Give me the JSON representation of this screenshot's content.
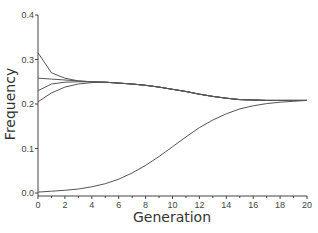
{
  "chart_data": {
    "type": "line",
    "title": "",
    "xlabel": "Generation",
    "ylabel": "Frequency",
    "xlim": [
      0,
      20
    ],
    "ylim": [
      0,
      0.4
    ],
    "grid": false,
    "legend": null,
    "x_ticks": [
      "0",
      "2",
      "4",
      "6",
      "8",
      "10",
      "12",
      "14",
      "16",
      "18",
      "20"
    ],
    "y_ticks": [
      "0.0",
      "0.1",
      "0.2",
      "0.3",
      "0.4"
    ],
    "x": [
      0,
      1,
      2,
      3,
      4,
      5,
      6,
      7,
      8,
      9,
      10,
      11,
      12,
      13,
      14,
      15,
      16,
      17,
      18,
      19,
      20
    ],
    "series": [
      {
        "name": "series-1",
        "values": [
          0.315,
          0.27,
          0.258,
          0.252,
          0.25,
          0.249,
          0.247,
          0.245,
          0.242,
          0.238,
          0.233,
          0.228,
          0.222,
          0.217,
          0.213,
          0.21,
          0.209,
          0.208,
          0.208,
          0.208,
          0.208
        ]
      },
      {
        "name": "series-2",
        "values": [
          0.258,
          0.256,
          0.254,
          0.252,
          0.25,
          0.249,
          0.247,
          0.245,
          0.242,
          0.238,
          0.233,
          0.228,
          0.222,
          0.217,
          0.213,
          0.21,
          0.209,
          0.208,
          0.208,
          0.208,
          0.208
        ]
      },
      {
        "name": "series-3",
        "values": [
          0.23,
          0.245,
          0.249,
          0.25,
          0.25,
          0.249,
          0.247,
          0.245,
          0.242,
          0.238,
          0.233,
          0.228,
          0.222,
          0.217,
          0.213,
          0.21,
          0.209,
          0.208,
          0.208,
          0.208,
          0.208
        ]
      },
      {
        "name": "series-4",
        "values": [
          0.205,
          0.225,
          0.238,
          0.245,
          0.248,
          0.249,
          0.247,
          0.245,
          0.242,
          0.238,
          0.233,
          0.228,
          0.222,
          0.217,
          0.213,
          0.21,
          0.209,
          0.208,
          0.208,
          0.208,
          0.208
        ]
      },
      {
        "name": "series-5",
        "values": [
          0.002,
          0.004,
          0.006,
          0.009,
          0.014,
          0.021,
          0.031,
          0.045,
          0.062,
          0.082,
          0.104,
          0.126,
          0.147,
          0.164,
          0.178,
          0.189,
          0.196,
          0.201,
          0.204,
          0.206,
          0.208
        ]
      }
    ]
  }
}
